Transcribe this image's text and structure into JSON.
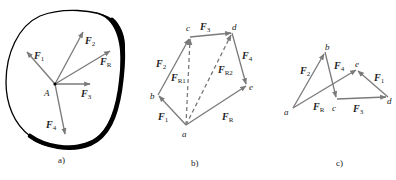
{
  "figure": {
    "panels": [
      {
        "id": "a",
        "caption": "a)",
        "point_label": "A",
        "forces": [
          {
            "name": "F",
            "sub": "1"
          },
          {
            "name": "F",
            "sub": "2"
          },
          {
            "name": "F",
            "sub": "R"
          },
          {
            "name": "F",
            "sub": "3"
          },
          {
            "name": "F",
            "sub": "4"
          }
        ]
      },
      {
        "id": "b",
        "caption": "b)",
        "vertices": [
          "a",
          "b",
          "c",
          "d",
          "e"
        ],
        "forces": [
          {
            "name": "F",
            "sub": "1",
            "from": "a",
            "to": "b"
          },
          {
            "name": "F",
            "sub": "2",
            "from": "b",
            "to": "c"
          },
          {
            "name": "F",
            "sub": "3",
            "from": "c",
            "to": "d"
          },
          {
            "name": "F",
            "sub": "4",
            "from": "d",
            "to": "e"
          },
          {
            "name": "F",
            "sub": "R",
            "from": "a",
            "to": "e"
          },
          {
            "name": "F",
            "sub": "R1",
            "from": "a",
            "to": "c",
            "dashed": true
          },
          {
            "name": "F",
            "sub": "R2",
            "from": "a",
            "to": "d",
            "dashed": true
          }
        ]
      },
      {
        "id": "c",
        "caption": "c)",
        "vertices": [
          "a",
          "b",
          "c",
          "d",
          "e"
        ],
        "forces": [
          {
            "name": "F",
            "sub": "2",
            "from": "a",
            "to": "b"
          },
          {
            "name": "F",
            "sub": "4",
            "from": "b",
            "to": "c"
          },
          {
            "name": "F",
            "sub": "3",
            "from": "c",
            "to": "d"
          },
          {
            "name": "F",
            "sub": "1",
            "from": "d",
            "to": "e"
          },
          {
            "name": "F",
            "sub": "R",
            "from": "a",
            "to": "e"
          }
        ]
      }
    ],
    "colors": {
      "ink": "#222222",
      "arrow": "#7a7a7a",
      "body_edge": "#000000"
    }
  }
}
